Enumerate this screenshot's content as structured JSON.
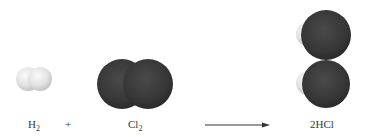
{
  "equation": {
    "reactant1": {
      "symbol": "H",
      "subscript": "2"
    },
    "operator": "+",
    "reactant2": {
      "symbol": "Cl",
      "subscript": "2"
    },
    "arrow": "→",
    "product": {
      "coefficient": "2",
      "symbol": "HCl"
    }
  },
  "colors": {
    "hydrogen": "#e6e6e6",
    "chlorine": "#3a3a3a",
    "background": "#ffffff",
    "text": "#3a3a3a"
  }
}
